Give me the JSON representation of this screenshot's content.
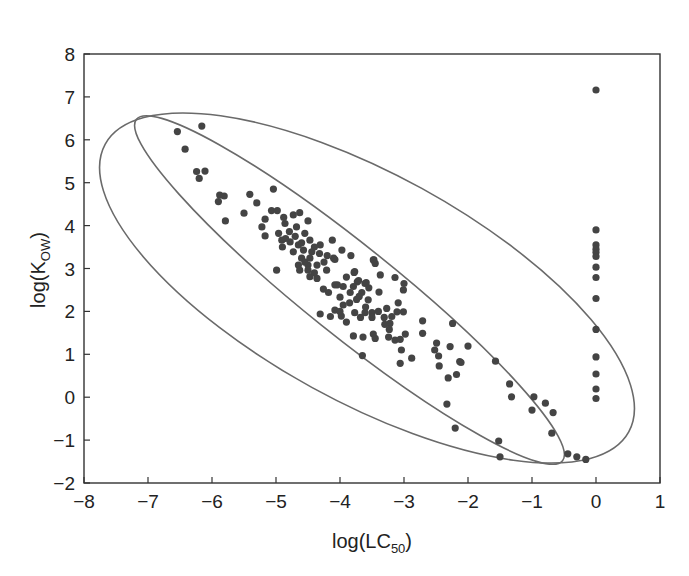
{
  "chart_data": {
    "type": "scatter",
    "title": "",
    "xlabel": "log(LC50)",
    "xlabel_main": "log(LC",
    "xlabel_sub": "50",
    "xlabel_end": ")",
    "ylabel": "log(KOW)",
    "ylabel_main": "log(K",
    "ylabel_sub": "OW",
    "ylabel_end": ")",
    "xlim": [
      -8,
      1
    ],
    "ylim": [
      -2,
      8
    ],
    "xticks": [
      -8,
      -7,
      -6,
      -5,
      -4,
      -3,
      -2,
      -1,
      0,
      1
    ],
    "yticks": [
      -2,
      -1,
      0,
      1,
      2,
      3,
      4,
      5,
      6,
      7,
      8
    ],
    "grid": false,
    "legend": null,
    "point_color": "#444444",
    "ellipse_color": "#6a6a6a",
    "ellipses": [
      {
        "name": "outer",
        "cx_data": -3.53,
        "cy_data": 2.49,
        "note": "wide confidence ellipse tilted downward"
      },
      {
        "name": "inner",
        "cx_data": -3.85,
        "cy_data": 2.5,
        "note": "narrow confidence ellipse along the trend"
      }
    ],
    "series": [
      {
        "name": "compounds",
        "points": [
          [
            -6.54,
            6.19
          ],
          [
            -6.16,
            6.32
          ],
          [
            -6.42,
            5.78
          ],
          [
            -6.24,
            5.26
          ],
          [
            -6.11,
            5.27
          ],
          [
            -6.2,
            5.1
          ],
          [
            -5.88,
            4.71
          ],
          [
            -5.81,
            4.69
          ],
          [
            -5.9,
            4.56
          ],
          [
            -5.41,
            4.73
          ],
          [
            -5.3,
            4.53
          ],
          [
            -5.5,
            4.29
          ],
          [
            -5.79,
            4.11
          ],
          [
            -5.04,
            4.85
          ],
          [
            -5.07,
            4.35
          ],
          [
            -4.98,
            4.35
          ],
          [
            -5.17,
            4.15
          ],
          [
            -4.88,
            4.19
          ],
          [
            -4.73,
            4.25
          ],
          [
            -4.63,
            4.3
          ],
          [
            -4.5,
            4.11
          ],
          [
            -5.22,
            3.97
          ],
          [
            -4.86,
            4.05
          ],
          [
            -4.68,
            3.97
          ],
          [
            -5.17,
            3.76
          ],
          [
            -4.96,
            3.82
          ],
          [
            -4.91,
            3.66
          ],
          [
            -4.79,
            3.86
          ],
          [
            -4.55,
            3.82
          ],
          [
            -4.47,
            3.66
          ],
          [
            -4.78,
            3.62
          ],
          [
            -4.65,
            3.55
          ],
          [
            -4.31,
            3.55
          ],
          [
            -4.12,
            3.66
          ],
          [
            -4.73,
            3.39
          ],
          [
            -4.57,
            3.43
          ],
          [
            -4.44,
            3.39
          ],
          [
            -4.32,
            3.35
          ],
          [
            -3.97,
            3.43
          ],
          [
            -3.83,
            3.3
          ],
          [
            -4.6,
            3.24
          ],
          [
            -4.47,
            3.24
          ],
          [
            -4.08,
            3.21
          ],
          [
            -3.47,
            3.2
          ],
          [
            -4.65,
            3.08
          ],
          [
            -4.5,
            3.08
          ],
          [
            -4.36,
            3.08
          ],
          [
            -4.99,
            2.96
          ],
          [
            -4.63,
            2.96
          ],
          [
            -4.5,
            2.96
          ],
          [
            -4.21,
            2.96
          ],
          [
            -3.77,
            2.93
          ],
          [
            -4.47,
            2.81
          ],
          [
            -4.36,
            2.77
          ],
          [
            -4.04,
            2.62
          ],
          [
            -3.73,
            2.69
          ],
          [
            -3.61,
            2.65
          ],
          [
            -4.1,
            3.24
          ],
          [
            -3.48,
            3.2
          ],
          [
            -3.45,
            3.12
          ],
          [
            -3.78,
            2.91
          ],
          [
            -3.37,
            2.85
          ],
          [
            -3.14,
            2.79
          ],
          [
            -3.71,
            2.72
          ],
          [
            -3.59,
            2.67
          ],
          [
            -3.0,
            2.65
          ],
          [
            -4.08,
            2.62
          ],
          [
            -3.95,
            2.58
          ],
          [
            -3.79,
            2.58
          ],
          [
            -4.26,
            2.52
          ],
          [
            -3.01,
            2.5
          ],
          [
            -4.18,
            2.44
          ],
          [
            -3.84,
            2.44
          ],
          [
            -3.66,
            2.44
          ],
          [
            -3.39,
            2.45
          ],
          [
            -4.0,
            2.33
          ],
          [
            -3.74,
            2.28
          ],
          [
            -3.56,
            2.27
          ],
          [
            -3.09,
            2.2
          ],
          [
            -3.95,
            2.15
          ],
          [
            -4.08,
            2.03
          ],
          [
            -3.27,
            2.07
          ],
          [
            -3.11,
            1.99
          ],
          [
            -3.01,
            1.99
          ],
          [
            -3.77,
            1.97
          ],
          [
            -3.61,
            1.97
          ],
          [
            -3.5,
            1.97
          ],
          [
            -4.31,
            1.94
          ],
          [
            -4.15,
            1.88
          ],
          [
            -3.98,
            1.89
          ],
          [
            -3.68,
            1.86
          ],
          [
            -3.5,
            1.86
          ],
          [
            -3.31,
            1.86
          ],
          [
            -3.19,
            1.88
          ],
          [
            -2.71,
            1.78
          ],
          [
            -3.22,
            1.72
          ],
          [
            -2.24,
            1.72
          ],
          [
            -3.23,
            1.58
          ],
          [
            -2.71,
            1.49
          ],
          [
            -3.79,
            1.43
          ],
          [
            -3.64,
            1.4
          ],
          [
            -3.48,
            1.47
          ],
          [
            -3.45,
            1.37
          ],
          [
            -3.24,
            1.4
          ],
          [
            -3.14,
            1.33
          ],
          [
            -3.06,
            1.35
          ],
          [
            -2.98,
            1.47
          ],
          [
            -2.49,
            1.26
          ],
          [
            -2.28,
            1.18
          ],
          [
            -2.0,
            1.19
          ],
          [
            -2.52,
            1.1
          ],
          [
            -3.04,
            1.1
          ],
          [
            -3.65,
            0.97
          ],
          [
            -2.46,
            0.96
          ],
          [
            -2.88,
            0.91
          ],
          [
            -3.06,
            0.79
          ],
          [
            -2.13,
            0.83
          ],
          [
            -2.45,
            0.73
          ],
          [
            -2.11,
            0.81
          ],
          [
            -1.57,
            0.84
          ],
          [
            -2.18,
            0.53
          ],
          [
            -2.31,
            0.45
          ],
          [
            -1.35,
            0.31
          ],
          [
            -1.32,
            0.01
          ],
          [
            -0.97,
            0.01
          ],
          [
            -0.79,
            -0.14
          ],
          [
            -1.0,
            -0.3
          ],
          [
            -0.67,
            -0.36
          ],
          [
            -2.33,
            -0.16
          ],
          [
            -2.2,
            -0.72
          ],
          [
            -0.69,
            -0.84
          ],
          [
            -1.52,
            -1.02
          ],
          [
            -1.5,
            -1.39
          ],
          [
            -0.44,
            -1.32
          ],
          [
            -0.3,
            -1.39
          ],
          [
            -0.16,
            -1.45
          ],
          [
            -4.85,
            3.7
          ],
          [
            -4.7,
            3.75
          ],
          [
            -4.4,
            3.5
          ],
          [
            -4.2,
            3.3
          ],
          [
            -4.9,
            3.5
          ],
          [
            -4.6,
            3.6
          ],
          [
            -4.55,
            3.15
          ],
          [
            -4.25,
            3.15
          ],
          [
            -4.4,
            2.9
          ],
          [
            -3.9,
            2.8
          ],
          [
            -3.85,
            2.2
          ],
          [
            -3.6,
            2.1
          ],
          [
            -3.4,
            2.0
          ],
          [
            -3.3,
            1.7
          ],
          [
            -3.9,
            1.75
          ],
          [
            -4.0,
            2.0
          ],
          [
            -3.7,
            2.35
          ],
          [
            -3.55,
            2.55
          ],
          [
            0.0,
            7.16
          ],
          [
            0.0,
            3.9
          ],
          [
            0.0,
            3.55
          ],
          [
            0.0,
            3.45
          ],
          [
            0.0,
            3.37
          ],
          [
            0.0,
            3.28
          ],
          [
            0.0,
            3.03
          ],
          [
            0.0,
            2.79
          ],
          [
            0.0,
            2.3
          ],
          [
            0.0,
            1.58
          ],
          [
            0.0,
            0.94
          ],
          [
            0.0,
            0.54
          ],
          [
            0.0,
            0.19
          ],
          [
            0.0,
            -0.03
          ]
        ]
      }
    ]
  }
}
